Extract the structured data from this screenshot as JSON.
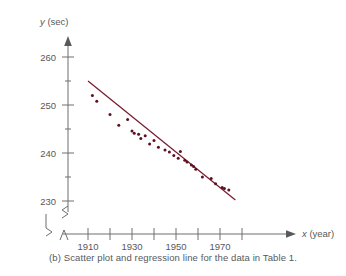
{
  "figure": {
    "caption": "(b) Scatter plot and regression line for the data in Table 1.",
    "y_axis_title": "y (sec)",
    "x_axis_title": "x (year)",
    "y_axis_title_italic": "y",
    "y_axis_title_unit": "(sec)",
    "x_axis_title_italic": "x",
    "x_axis_title_unit": "(year)"
  },
  "chart_data": {
    "type": "scatter",
    "title": "",
    "subtitle": "",
    "xlabel": "x (year)",
    "ylabel": "y (sec)",
    "xlim": [
      1904,
      1984
    ],
    "ylim": [
      228,
      262
    ],
    "grid": false,
    "legend": null,
    "axis_break": true,
    "x_ticks": [
      1910,
      1920,
      1930,
      1940,
      1950,
      1960,
      1970,
      1980
    ],
    "x_tick_labels": [
      "1910",
      "",
      "1930",
      "",
      "1950",
      "",
      "1970",
      ""
    ],
    "x_major_labeled": [
      1910,
      1930,
      1950,
      1970
    ],
    "y_ticks": [
      230,
      235,
      240,
      245,
      250,
      255,
      260
    ],
    "y_tick_labels": [
      "230",
      "",
      "240",
      "",
      "250",
      "",
      "260"
    ],
    "y_major_labeled": [
      230,
      240,
      250,
      260
    ],
    "points": [
      {
        "x": 1912,
        "y": 252.0
      },
      {
        "x": 1914,
        "y": 250.8
      },
      {
        "x": 1920,
        "y": 248.0
      },
      {
        "x": 1924,
        "y": 245.8
      },
      {
        "x": 1928,
        "y": 247.0
      },
      {
        "x": 1930,
        "y": 244.6
      },
      {
        "x": 1931,
        "y": 244.1
      },
      {
        "x": 1933,
        "y": 243.9
      },
      {
        "x": 1934,
        "y": 243.0
      },
      {
        "x": 1936,
        "y": 243.6
      },
      {
        "x": 1938,
        "y": 241.9
      },
      {
        "x": 1940,
        "y": 242.6
      },
      {
        "x": 1942,
        "y": 241.2
      },
      {
        "x": 1945,
        "y": 240.6
      },
      {
        "x": 1947,
        "y": 240.2
      },
      {
        "x": 1949,
        "y": 239.5
      },
      {
        "x": 1951,
        "y": 238.9
      },
      {
        "x": 1952,
        "y": 240.3
      },
      {
        "x": 1954,
        "y": 238.5
      },
      {
        "x": 1955,
        "y": 238.1
      },
      {
        "x": 1957,
        "y": 237.5
      },
      {
        "x": 1958,
        "y": 237.2
      },
      {
        "x": 1959,
        "y": 236.6
      },
      {
        "x": 1962,
        "y": 235.0
      },
      {
        "x": 1966,
        "y": 234.7
      },
      {
        "x": 1968,
        "y": 233.6
      },
      {
        "x": 1971,
        "y": 232.8
      },
      {
        "x": 1972,
        "y": 232.6
      },
      {
        "x": 1974,
        "y": 232.3
      }
    ],
    "regression_line": {
      "x_start": 1910,
      "y_start": 255.0,
      "x_end": 1977,
      "y_end": 230.2,
      "color": "#7a1b2e"
    },
    "point_color": "#5e1020"
  }
}
